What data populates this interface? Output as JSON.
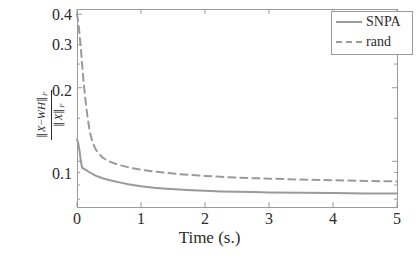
{
  "chart_data": {
    "type": "line",
    "title": "",
    "xlabel": "Time (s.)",
    "ylabel_numerator": "||X - WH||_F",
    "ylabel_denominator": "||X||_F",
    "xlim": [
      0,
      5
    ],
    "ylim": [
      0.065,
      0.42
    ],
    "yscale": "log",
    "xscale": "linear",
    "grid": false,
    "legend_position": "top-right",
    "xticks": [
      "0",
      "1",
      "2",
      "3",
      "4",
      "5"
    ],
    "xtick_values": [
      0,
      1,
      2,
      3,
      4,
      5
    ],
    "yticks": [
      "0.1",
      "0.2",
      "0.3",
      "0.4"
    ],
    "ytick_values": [
      0.1,
      0.2,
      0.3,
      0.4
    ],
    "series": [
      {
        "name": "SNPA",
        "style": "solid",
        "color": "#9a9a9a",
        "x": [
          0.0,
          0.02,
          0.04,
          0.06,
          0.08,
          0.1,
          0.13,
          0.16,
          0.2,
          0.25,
          0.3,
          0.4,
          0.5,
          0.6,
          0.7,
          0.8,
          0.9,
          1.0,
          1.2,
          1.4,
          1.6,
          1.8,
          2.0,
          2.25,
          2.5,
          2.75,
          3.0,
          3.5,
          4.0,
          4.5,
          5.0
        ],
        "values": [
          0.123,
          0.118,
          0.11,
          0.1,
          0.094,
          0.0935,
          0.0925,
          0.0915,
          0.09,
          0.0885,
          0.0872,
          0.0852,
          0.0838,
          0.0826,
          0.0816,
          0.0806,
          0.0798,
          0.0791,
          0.078,
          0.0772,
          0.0766,
          0.0761,
          0.0757,
          0.0753,
          0.075,
          0.0748,
          0.0746,
          0.0743,
          0.0741,
          0.0739,
          0.0738
        ]
      },
      {
        "name": "rand",
        "style": "dashed",
        "color": "#9a9a9a",
        "x": [
          0.0,
          0.02,
          0.04,
          0.06,
          0.08,
          0.1,
          0.13,
          0.16,
          0.2,
          0.25,
          0.3,
          0.4,
          0.5,
          0.6,
          0.7,
          0.8,
          0.9,
          1.0,
          1.2,
          1.4,
          1.6,
          1.8,
          2.0,
          2.25,
          2.5,
          2.75,
          3.0,
          3.5,
          4.0,
          4.5,
          5.0
        ],
        "values": [
          0.4,
          0.37,
          0.33,
          0.29,
          0.25,
          0.215,
          0.18,
          0.155,
          0.132,
          0.118,
          0.111,
          0.1035,
          0.1,
          0.0977,
          0.096,
          0.0946,
          0.0934,
          0.0924,
          0.0908,
          0.0896,
          0.0886,
          0.0878,
          0.0871,
          0.0864,
          0.0858,
          0.0853,
          0.0849,
          0.0842,
          0.0836,
          0.0831,
          0.0827
        ]
      }
    ],
    "legend": [
      {
        "label": "SNPA",
        "style": "solid"
      },
      {
        "label": "rand",
        "style": "dashed"
      }
    ]
  },
  "axes": {
    "frame_color": "#9a9a9a",
    "text_color": "#2b2b2b"
  }
}
